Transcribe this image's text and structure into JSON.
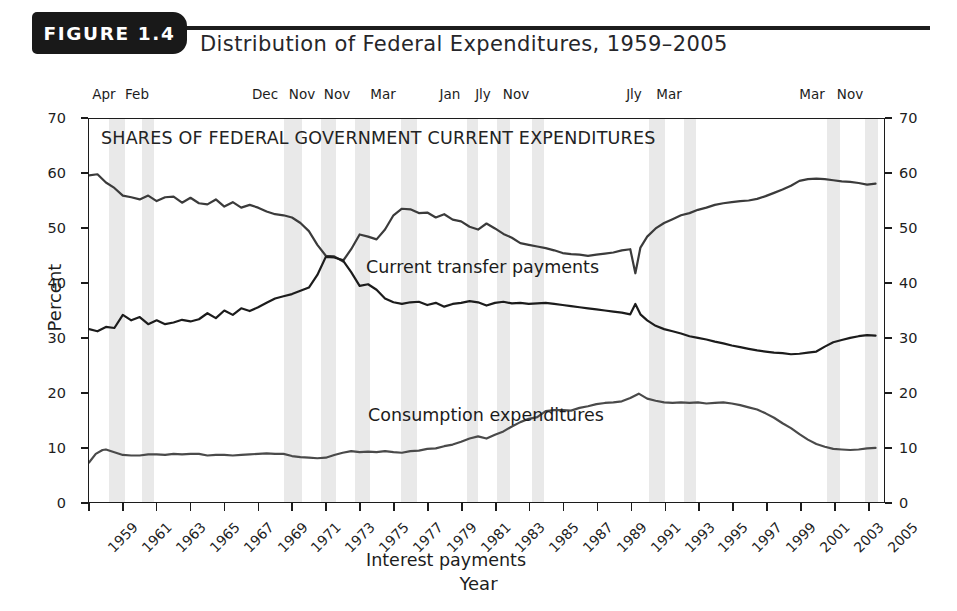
{
  "header": {
    "figure_tab": "FIGURE 1.4",
    "title": "Distribution of Federal Expenditures, 1959–2005"
  },
  "chart_data": {
    "type": "line",
    "title": "SHARES OF FEDERAL GOVERNMENT CURRENT EXPENDITURES",
    "xlabel": "Year",
    "ylabel": "Percent",
    "xlim": [
      1959,
      2006
    ],
    "ylim": [
      0,
      70
    ],
    "ytick_values": [
      0,
      10,
      20,
      30,
      40,
      50,
      60,
      70
    ],
    "ytick_labels": [
      "0",
      "10",
      "20",
      "30",
      "40",
      "50",
      "60",
      "70"
    ],
    "xtick_values": [
      1959,
      1961,
      1963,
      1965,
      1967,
      1969,
      1971,
      1973,
      1975,
      1977,
      1979,
      1981,
      1983,
      1985,
      1987,
      1989,
      1991,
      1993,
      1995,
      1997,
      1999,
      2001,
      2003,
      2005
    ],
    "xtick_labels": [
      "1959",
      "1961",
      "1963",
      "1965",
      "1967",
      "1969",
      "1971",
      "1973",
      "1975",
      "1977",
      "1979",
      "1981",
      "1983",
      "1985",
      "1987",
      "1989",
      "1991",
      "1993",
      "1995",
      "1997",
      "1999",
      "2001",
      "2003",
      "2005"
    ],
    "grid": false,
    "legend_position": "inline-annotations",
    "axis_right_mirrored": true,
    "series": [
      {
        "name": "Current transfer payments",
        "color": "#3b3b3b",
        "label_position": {
          "x": 366,
          "y": 185
        },
        "x": [
          1959.0,
          1959.5,
          1960.0,
          1960.5,
          1961.0,
          1961.5,
          1962.0,
          1962.5,
          1963.0,
          1963.5,
          1964.0,
          1964.5,
          1965.0,
          1965.5,
          1966.0,
          1966.5,
          1967.0,
          1967.5,
          1968.0,
          1968.5,
          1969.0,
          1969.5,
          1970.0,
          1970.5,
          1971.0,
          1971.5,
          1972.0,
          1972.5,
          1973.0,
          1973.5,
          1974.0,
          1974.5,
          1975.0,
          1975.5,
          1976.0,
          1976.5,
          1977.0,
          1977.5,
          1978.0,
          1978.5,
          1979.0,
          1979.5,
          1980.0,
          1980.5,
          1981.0,
          1981.5,
          1982.0,
          1982.5,
          1983.0,
          1983.5,
          1984.0,
          1984.5,
          1985.0,
          1985.5,
          1986.0,
          1986.5,
          1987.0,
          1987.5,
          1988.0,
          1988.5,
          1989.0,
          1989.5,
          1990.0,
          1990.5,
          1991.0,
          1991.3,
          1991.6,
          1992.0,
          1992.5,
          1993.0,
          1993.5,
          1994.0,
          1994.5,
          1995.0,
          1995.5,
          1996.0,
          1996.5,
          1997.0,
          1997.5,
          1998.0,
          1998.5,
          1999.0,
          1999.5,
          2000.0,
          2000.5,
          2001.0,
          2001.5,
          2002.0,
          2002.5,
          2003.0,
          2003.5,
          2004.0,
          2004.5,
          2005.0,
          2005.5
        ],
        "y": [
          59.7,
          59.9,
          58.4,
          57.4,
          56.0,
          55.7,
          55.3,
          56.0,
          55.0,
          55.7,
          55.8,
          54.7,
          55.6,
          54.6,
          54.4,
          55.3,
          54.0,
          54.8,
          53.8,
          54.3,
          53.8,
          53.1,
          52.6,
          52.4,
          52.0,
          51.0,
          49.5,
          47.0,
          45.0,
          44.9,
          44.0,
          46.2,
          48.9,
          48.5,
          48.0,
          49.8,
          52.4,
          53.6,
          53.5,
          52.8,
          52.9,
          52.0,
          52.6,
          51.6,
          51.3,
          50.3,
          49.8,
          50.9,
          50.0,
          49.0,
          48.3,
          47.3,
          47.0,
          46.7,
          46.4,
          46.0,
          45.5,
          45.3,
          45.2,
          45.0,
          45.2,
          45.4,
          45.6,
          46.0,
          46.2,
          41.8,
          46.5,
          48.5,
          50.0,
          51.0,
          51.7,
          52.4,
          52.8,
          53.4,
          53.8,
          54.3,
          54.6,
          54.8,
          55.0,
          55.1,
          55.4,
          55.9,
          56.5,
          57.1,
          57.8,
          58.7,
          59.0,
          59.1,
          59.0,
          58.8,
          58.6,
          58.5,
          58.3,
          58.0,
          58.2
        ]
      },
      {
        "name": "Consumption expenditures",
        "color": "#1c1c1c",
        "label_position": {
          "x": 368,
          "y": 333
        },
        "x": [
          1959.0,
          1959.5,
          1960.0,
          1960.5,
          1961.0,
          1961.5,
          1962.0,
          1962.5,
          1963.0,
          1963.5,
          1964.0,
          1964.5,
          1965.0,
          1965.5,
          1966.0,
          1966.5,
          1967.0,
          1967.5,
          1968.0,
          1968.5,
          1969.0,
          1969.5,
          1970.0,
          1970.5,
          1971.0,
          1971.5,
          1972.0,
          1972.5,
          1973.0,
          1973.5,
          1974.0,
          1974.5,
          1975.0,
          1975.5,
          1976.0,
          1976.5,
          1977.0,
          1977.5,
          1978.0,
          1978.5,
          1979.0,
          1979.5,
          1980.0,
          1980.5,
          1981.0,
          1981.5,
          1982.0,
          1982.5,
          1983.0,
          1983.5,
          1984.0,
          1984.5,
          1985.0,
          1985.5,
          1986.0,
          1986.5,
          1987.0,
          1987.5,
          1988.0,
          1988.5,
          1989.0,
          1989.5,
          1990.0,
          1990.5,
          1991.0,
          1991.3,
          1991.6,
          1992.0,
          1992.5,
          1993.0,
          1993.5,
          1994.0,
          1994.5,
          1995.0,
          1995.5,
          1996.0,
          1996.5,
          1997.0,
          1997.5,
          1998.0,
          1998.5,
          1999.0,
          1999.5,
          2000.0,
          2000.5,
          2001.0,
          2001.5,
          2002.0,
          2002.5,
          2003.0,
          2003.5,
          2004.0,
          2004.5,
          2005.0,
          2005.5
        ],
        "y": [
          31.6,
          31.2,
          32.0,
          31.8,
          34.2,
          33.2,
          33.8,
          32.5,
          33.2,
          32.5,
          32.8,
          33.3,
          33.0,
          33.4,
          34.5,
          33.6,
          35.0,
          34.2,
          35.4,
          34.9,
          35.6,
          36.4,
          37.2,
          37.6,
          38.0,
          38.6,
          39.2,
          41.5,
          44.8,
          44.7,
          44.2,
          42.0,
          39.5,
          39.8,
          38.8,
          37.2,
          36.5,
          36.2,
          36.5,
          36.6,
          36.0,
          36.4,
          35.7,
          36.2,
          36.4,
          36.7,
          36.5,
          35.9,
          36.4,
          36.6,
          36.3,
          36.4,
          36.2,
          36.3,
          36.4,
          36.2,
          36.0,
          35.8,
          35.6,
          35.4,
          35.2,
          35.0,
          34.8,
          34.6,
          34.3,
          36.2,
          34.3,
          33.2,
          32.2,
          31.6,
          31.2,
          30.8,
          30.3,
          30.0,
          29.7,
          29.3,
          29.0,
          28.6,
          28.3,
          28.0,
          27.7,
          27.5,
          27.3,
          27.2,
          27.0,
          27.1,
          27.3,
          27.5,
          28.4,
          29.2,
          29.6,
          30.0,
          30.3,
          30.5,
          30.4
        ]
      },
      {
        "name": "Interest payments",
        "color": "#4a4a4a",
        "label_position": {
          "x": 366,
          "y": 478
        },
        "x": [
          1959.0,
          1959.4,
          1959.8,
          1960.0,
          1960.5,
          1961.0,
          1961.5,
          1962.0,
          1962.5,
          1963.0,
          1963.5,
          1964.0,
          1964.5,
          1965.0,
          1965.5,
          1966.0,
          1966.5,
          1967.0,
          1967.5,
          1968.0,
          1968.5,
          1969.0,
          1969.5,
          1970.0,
          1970.5,
          1971.0,
          1971.5,
          1972.0,
          1972.5,
          1973.0,
          1973.5,
          1974.0,
          1974.5,
          1975.0,
          1975.5,
          1976.0,
          1976.5,
          1977.0,
          1977.5,
          1978.0,
          1978.5,
          1979.0,
          1979.5,
          1980.0,
          1980.5,
          1981.0,
          1981.5,
          1982.0,
          1982.5,
          1983.0,
          1983.5,
          1984.0,
          1984.5,
          1985.0,
          1985.5,
          1986.0,
          1986.5,
          1987.0,
          1987.5,
          1988.0,
          1988.5,
          1989.0,
          1989.5,
          1990.0,
          1990.5,
          1991.0,
          1991.5,
          1992.0,
          1992.5,
          1993.0,
          1993.5,
          1994.0,
          1994.5,
          1995.0,
          1995.5,
          1996.0,
          1996.5,
          1997.0,
          1997.5,
          1998.0,
          1998.5,
          1999.0,
          1999.5,
          2000.0,
          2000.5,
          2001.0,
          2001.5,
          2002.0,
          2002.5,
          2003.0,
          2003.5,
          2004.0,
          2004.5,
          2005.0,
          2005.5
        ],
        "y": [
          7.2,
          8.8,
          9.5,
          9.6,
          9.1,
          8.6,
          8.5,
          8.5,
          8.7,
          8.7,
          8.6,
          8.8,
          8.7,
          8.8,
          8.8,
          8.5,
          8.6,
          8.6,
          8.5,
          8.6,
          8.7,
          8.8,
          8.9,
          8.8,
          8.8,
          8.4,
          8.2,
          8.1,
          8.0,
          8.1,
          8.6,
          9.0,
          9.3,
          9.1,
          9.2,
          9.1,
          9.3,
          9.1,
          9.0,
          9.3,
          9.4,
          9.7,
          9.8,
          10.2,
          10.5,
          11.0,
          11.6,
          12.0,
          11.6,
          12.3,
          12.9,
          13.8,
          14.6,
          15.2,
          15.5,
          16.6,
          16.8,
          16.8,
          16.7,
          17.2,
          17.5,
          17.9,
          18.1,
          18.2,
          18.4,
          19.0,
          19.8,
          18.9,
          18.5,
          18.2,
          18.1,
          18.2,
          18.1,
          18.2,
          18.0,
          18.1,
          18.2,
          18.0,
          17.7,
          17.3,
          16.9,
          16.2,
          15.4,
          14.4,
          13.5,
          12.4,
          11.4,
          10.6,
          10.1,
          9.7,
          9.6,
          9.5,
          9.6,
          9.8,
          9.9
        ]
      }
    ],
    "recession_bands": [
      {
        "label": "Apr",
        "start": 1960.33,
        "end": 1961.17
      },
      {
        "label": "Feb",
        "start": 1961.92,
        "end": 1962.42
      },
      {
        "label": "Dec",
        "start": 1969.92,
        "end": 1970.92
      },
      {
        "label": "Nov",
        "start": 1973.83,
        "end": 1975.25
      },
      {
        "label": "Nov",
        "start": 1976.0,
        "end": 1976.6
      },
      {
        "label": "Mar",
        "start": 1979.5,
        "end": 1980.6
      },
      {
        "label": "Jan",
        "start": 1983.0,
        "end": 1983.6
      },
      {
        "label": "Jly",
        "start": 1984.0,
        "end": 1984.6
      },
      {
        "label": "Nov",
        "start": 1986.5,
        "end": 1987.3
      },
      {
        "label": "Jly",
        "start": 1993.0,
        "end": 1993.7
      },
      {
        "label": "Mar",
        "start": 1994.4,
        "end": 1995.1
      },
      {
        "label": "Mar",
        "start": 2002.2,
        "end": 2002.9
      },
      {
        "label": "Nov",
        "start": 2003.5,
        "end": 2004.2
      }
    ],
    "top_month_labels": [
      {
        "text": "Apr",
        "x": 104
      },
      {
        "text": "Feb",
        "x": 137
      },
      {
        "text": "Dec",
        "x": 265
      },
      {
        "text": "Nov",
        "x": 302
      },
      {
        "text": "Nov",
        "x": 337
      },
      {
        "text": "Mar",
        "x": 383
      },
      {
        "text": "Jan",
        "x": 450
      },
      {
        "text": "Jly",
        "x": 483
      },
      {
        "text": "Nov",
        "x": 516
      },
      {
        "text": "Jly",
        "x": 634
      },
      {
        "text": "Mar",
        "x": 669
      },
      {
        "text": "Mar",
        "x": 812
      },
      {
        "text": "Nov",
        "x": 850
      }
    ],
    "band_pixels": [
      {
        "x": 108,
        "w": 16
      },
      {
        "x": 141,
        "w": 12
      },
      {
        "x": 283,
        "w": 18
      },
      {
        "x": 320,
        "w": 15
      },
      {
        "x": 354,
        "w": 15
      },
      {
        "x": 400,
        "w": 16
      },
      {
        "x": 466,
        "w": 11
      },
      {
        "x": 496,
        "w": 13
      },
      {
        "x": 531,
        "w": 12
      },
      {
        "x": 648,
        "w": 16
      },
      {
        "x": 683,
        "w": 12
      },
      {
        "x": 826,
        "w": 13
      },
      {
        "x": 864,
        "w": 13
      }
    ]
  }
}
